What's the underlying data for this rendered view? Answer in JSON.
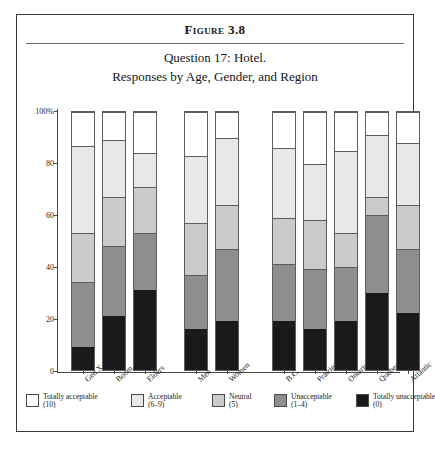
{
  "figure": {
    "label": "Figure 3.8",
    "question": "Question 17: Hotel.",
    "subtitle": "Responses by Age, Gender, and Region"
  },
  "legend": [
    {
      "name": "Totally acceptable",
      "score": "(10)",
      "color": "#ffffff"
    },
    {
      "name": "Acceptable",
      "score": "(6–9)",
      "color": "#e8e8e8"
    },
    {
      "name": "Neutral",
      "score": "(5)",
      "color": "#cbcbcb"
    },
    {
      "name": "Unacceptable",
      "score": "(1–4)",
      "color": "#8f8f8f"
    },
    {
      "name": "Totally unacceptable",
      "score": "(0)",
      "color": "#1a1a1a"
    }
  ],
  "chart_data": {
    "type": "bar",
    "subtype": "stacked-percentage",
    "title": "Question 17: Hotel.",
    "subtitle": "Responses by Age, Gender, and Region",
    "xlabel": "",
    "ylabel": "",
    "ylim": [
      0,
      100
    ],
    "yticks": [
      "0",
      "20",
      "40",
      "60",
      "80",
      "100%"
    ],
    "ytick_values": [
      0,
      20,
      40,
      60,
      80,
      100
    ],
    "grid": false,
    "legend_position": "bottom",
    "groups": [
      "Age",
      "Gender",
      "Region"
    ],
    "categories": [
      "Gen X",
      "Boom",
      "Elders",
      "Men",
      "Women",
      "B.C.",
      "Prairies",
      "Ontario",
      "Quebec",
      "Atlantic"
    ],
    "series": [
      {
        "name": "Totally unacceptable",
        "score": "(0)",
        "color": "#1a1a1a",
        "values": [
          9,
          21,
          31,
          16,
          19,
          19,
          16,
          19,
          30,
          22
        ]
      },
      {
        "name": "Unacceptable",
        "score": "(1–4)",
        "color": "#8f8f8f",
        "values": [
          25,
          27,
          22,
          21,
          28,
          22,
          23,
          21,
          30,
          25
        ]
      },
      {
        "name": "Neutral",
        "score": "(5)",
        "color": "#cbcbcb",
        "values": [
          19,
          19,
          18,
          20,
          17,
          18,
          19,
          13,
          7,
          17
        ]
      },
      {
        "name": "Acceptable",
        "score": "(6–9)",
        "color": "#e8e8e8",
        "values": [
          34,
          22,
          13,
          26,
          26,
          27,
          22,
          32,
          24,
          24
        ]
      },
      {
        "name": "Totally acceptable",
        "score": "(10)",
        "color": "#ffffff",
        "values": [
          13,
          11,
          16,
          17,
          10,
          14,
          20,
          15,
          9,
          12
        ]
      }
    ],
    "cumulative_tops": {
      "Gen X": {
        "black": 9,
        "dark": 34,
        "mid": 53,
        "light": 87
      },
      "Boom": {
        "black": 21,
        "dark": 48,
        "mid": 67,
        "light": 89
      },
      "Elders": {
        "black": 31,
        "dark": 53,
        "mid": 71,
        "light": 84
      },
      "Men": {
        "black": 16,
        "dark": 37,
        "mid": 57,
        "light": 83
      },
      "Women": {
        "black": 19,
        "dark": 47,
        "mid": 64,
        "light": 90
      },
      "B.C.": {
        "black": 19,
        "dark": 41,
        "mid": 59,
        "light": 86
      },
      "Prairies": {
        "black": 16,
        "dark": 39,
        "mid": 58,
        "light": 80
      },
      "Ontario": {
        "black": 19,
        "dark": 40,
        "mid": 53,
        "light": 85
      },
      "Quebec": {
        "black": 30,
        "dark": 60,
        "mid": 67,
        "light": 91
      },
      "Atlantic": {
        "black": 22,
        "dark": 47,
        "mid": 64,
        "light": 88
      }
    }
  },
  "layout": {
    "bar_x": [
      13,
      44,
      75,
      126,
      157,
      214,
      245,
      276,
      307,
      338
    ],
    "legend_x": [
      0,
      105,
      186,
      248,
      330
    ]
  }
}
